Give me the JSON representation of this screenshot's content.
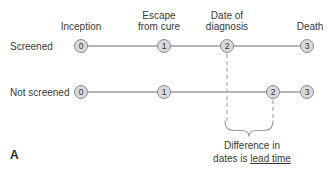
{
  "figure": {
    "panel_label": "A",
    "colors": {
      "timeline_line": "#9c9c9c",
      "node_fill": "#d9d9d9",
      "node_border": "#8c8c8c",
      "dashed_line": "#b0b0b0",
      "text": "#3a3a3a"
    },
    "milestone_labels": [
      {
        "id": "inception",
        "label": "Inception"
      },
      {
        "id": "escape-from-cure",
        "label": "Escape\nfrom cure"
      },
      {
        "id": "date-of-diagnosis",
        "label": "Date of\ndiagnosis"
      },
      {
        "id": "death",
        "label": "Death"
      }
    ],
    "timelines": [
      {
        "name": "Screened",
        "nodes": [
          "0",
          "1",
          "2",
          "3"
        ]
      },
      {
        "name": "Not screened",
        "nodes": [
          "0",
          "1",
          "2",
          "3"
        ]
      }
    ],
    "annotation": {
      "line1": "Difference in",
      "line2_prefix": "dates is ",
      "line2_underlined": "lead time"
    }
  }
}
